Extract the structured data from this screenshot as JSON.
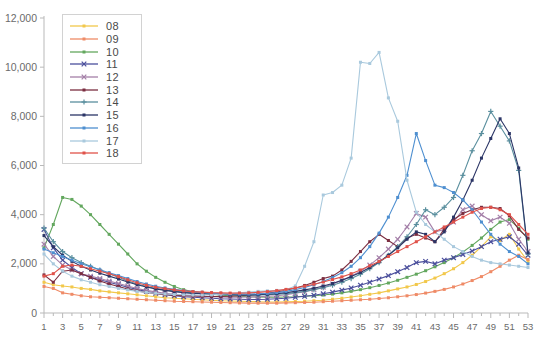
{
  "chart_data": {
    "type": "line",
    "title": "",
    "xlabel": "",
    "ylabel": "",
    "xlim": [
      1,
      53
    ],
    "ylim": [
      0,
      12000
    ],
    "ytick_values": [
      0,
      2000,
      4000,
      6000,
      8000,
      10000,
      12000
    ],
    "ytick_labels": [
      "0",
      "2,000",
      "4,000",
      "6,000",
      "8,000",
      "10,000",
      "12,000"
    ],
    "x": [
      1,
      2,
      3,
      4,
      5,
      6,
      7,
      8,
      9,
      10,
      11,
      12,
      13,
      14,
      15,
      16,
      17,
      18,
      19,
      20,
      21,
      22,
      23,
      24,
      25,
      26,
      27,
      28,
      29,
      30,
      31,
      32,
      33,
      34,
      35,
      36,
      37,
      38,
      39,
      40,
      41,
      42,
      43,
      44,
      45,
      46,
      47,
      48,
      49,
      50,
      51,
      52,
      53
    ],
    "xtick_labels": [
      "1",
      "",
      "3",
      "",
      "5",
      "",
      "7",
      "",
      "9",
      "",
      "11",
      "",
      "13",
      "",
      "15",
      "",
      "17",
      "",
      "19",
      "",
      "21",
      "",
      "23",
      "",
      "25",
      "",
      "27",
      "",
      "29",
      "",
      "31",
      "",
      "33",
      "",
      "35",
      "",
      "37",
      "",
      "39",
      "",
      "41",
      "",
      "43",
      "",
      "45",
      "",
      "47",
      "",
      "49",
      "",
      "51",
      "",
      "53"
    ],
    "grid": false,
    "legend_position": "top-left",
    "series": [
      {
        "name": "08",
        "color": "#f2c84b",
        "marker": "dot",
        "values": [
          1250,
          1150,
          1100,
          1060,
          1000,
          960,
          900,
          860,
          820,
          780,
          740,
          700,
          660,
          620,
          600,
          580,
          560,
          540,
          520,
          500,
          490,
          480,
          470,
          460,
          450,
          450,
          460,
          470,
          480,
          500,
          520,
          560,
          600,
          650,
          700,
          760,
          820,
          900,
          980,
          1060,
          1160,
          1280,
          1420,
          1600,
          1800,
          2050,
          2350,
          2700,
          3100,
          2950,
          3200,
          2600,
          2100
        ]
      },
      {
        "name": "09",
        "color": "#ef8b67",
        "marker": "dot",
        "values": [
          1080,
          1000,
          820,
          760,
          700,
          660,
          640,
          620,
          600,
          580,
          560,
          540,
          520,
          500,
          480,
          470,
          460,
          450,
          440,
          430,
          420,
          410,
          400,
          400,
          400,
          400,
          410,
          420,
          430,
          440,
          460,
          480,
          500,
          520,
          540,
          560,
          590,
          620,
          660,
          700,
          750,
          810,
          880,
          960,
          1060,
          1180,
          1320,
          1480,
          1680,
          1900,
          2150,
          2350,
          2180
        ]
      },
      {
        "name": "10",
        "color": "#63a75e",
        "marker": "dot",
        "values": [
          2650,
          3600,
          4700,
          4620,
          4350,
          4000,
          3600,
          3200,
          2800,
          2400,
          2000,
          1700,
          1450,
          1250,
          1080,
          950,
          860,
          800,
          760,
          720,
          700,
          680,
          660,
          650,
          640,
          640,
          650,
          660,
          680,
          700,
          730,
          770,
          820,
          880,
          950,
          1030,
          1120,
          1220,
          1330,
          1450,
          1580,
          1720,
          1880,
          2050,
          2250,
          2480,
          2750,
          3050,
          3400,
          3700,
          3800,
          3450,
          3000
        ]
      },
      {
        "name": "11",
        "color": "#4b4f9c",
        "marker": "x",
        "values": [
          3400,
          2650,
          2150,
          1850,
          1600,
          1450,
          1350,
          1250,
          1150,
          1050,
          960,
          880,
          800,
          740,
          700,
          660,
          640,
          620,
          600,
          580,
          570,
          560,
          550,
          550,
          560,
          580,
          600,
          640,
          680,
          720,
          780,
          850,
          930,
          1020,
          1130,
          1250,
          1380,
          1520,
          1680,
          1850,
          2050,
          2100,
          2000,
          2150,
          2250,
          2380,
          2520,
          2700,
          2900,
          3000,
          3100,
          2800,
          2350
        ]
      },
      {
        "name": "12",
        "color": "#a47fa8",
        "marker": "x",
        "values": [
          2800,
          2300,
          1950,
          1750,
          1600,
          1500,
          1400,
          1300,
          1200,
          1100,
          1000,
          920,
          860,
          800,
          760,
          720,
          700,
          680,
          660,
          650,
          640,
          640,
          650,
          660,
          680,
          700,
          740,
          800,
          870,
          950,
          1050,
          1180,
          1320,
          1500,
          1700,
          1950,
          2250,
          2600,
          3000,
          3500,
          4050,
          3900,
          3300,
          3400,
          3700,
          4200,
          4350,
          4000,
          3750,
          3900,
          3650,
          3000,
          2500
        ]
      },
      {
        "name": "13",
        "color": "#7b2d40",
        "marker": "dot",
        "values": [
          1550,
          1250,
          1700,
          1750,
          1600,
          1450,
          1300,
          1180,
          1080,
          980,
          900,
          840,
          790,
          750,
          720,
          700,
          690,
          680,
          670,
          670,
          680,
          700,
          720,
          760,
          800,
          860,
          930,
          1020,
          1120,
          1250,
          1400,
          1500,
          1750,
          2100,
          2500,
          2900,
          3200,
          2950,
          2700,
          3050,
          3200,
          3050,
          2900,
          3400,
          3800,
          4050,
          4200,
          4300,
          4300,
          4250,
          3950,
          3400,
          3050
        ]
      },
      {
        "name": "14",
        "color": "#5a8f9e",
        "marker": "plus",
        "values": [
          3450,
          2900,
          2500,
          2250,
          2050,
          1900,
          1750,
          1600,
          1450,
          1300,
          1180,
          1080,
          1000,
          940,
          890,
          850,
          820,
          800,
          780,
          760,
          750,
          740,
          730,
          730,
          740,
          760,
          790,
          830,
          880,
          950,
          1030,
          1130,
          1250,
          1400,
          1580,
          1800,
          2050,
          2350,
          2700,
          3100,
          3600,
          4200,
          4000,
          4300,
          4700,
          5600,
          6600,
          7300,
          8200,
          7600,
          7000,
          5800,
          2400
        ]
      },
      {
        "name": "15",
        "color": "#2b3566",
        "marker": "dot",
        "values": [
          3150,
          2700,
          2350,
          2100,
          1900,
          1750,
          1620,
          1500,
          1380,
          1260,
          1150,
          1060,
          980,
          920,
          870,
          830,
          800,
          780,
          760,
          750,
          740,
          730,
          730,
          740,
          760,
          790,
          830,
          880,
          940,
          1010,
          1100,
          1200,
          1330,
          1480,
          1650,
          1850,
          2080,
          2350,
          2650,
          3000,
          3300,
          3200,
          2900,
          3300,
          3900,
          4600,
          5400,
          6300,
          7100,
          7900,
          7300,
          5900,
          2450
        ]
      },
      {
        "name": "16",
        "color": "#4e8fd0",
        "marker": "dot",
        "values": [
          2600,
          2450,
          2300,
          2150,
          2000,
          1880,
          1760,
          1640,
          1520,
          1400,
          1280,
          1180,
          1090,
          1020,
          960,
          910,
          870,
          840,
          810,
          790,
          780,
          770,
          770,
          780,
          800,
          830,
          880,
          950,
          1040,
          1150,
          1280,
          1440,
          1640,
          1900,
          2250,
          2700,
          3250,
          3900,
          4700,
          5600,
          7300,
          6200,
          5200,
          5100,
          4900,
          4600,
          4200,
          3700,
          3200,
          2800,
          2500,
          2300,
          2000
        ]
      },
      {
        "name": "17",
        "color": "#a9c9dd",
        "marker": "dot",
        "values": [
          2400,
          2000,
          1700,
          1500,
          1350,
          1250,
          1150,
          1080,
          1000,
          940,
          880,
          840,
          800,
          770,
          750,
          740,
          730,
          730,
          740,
          760,
          790,
          820,
          850,
          880,
          900,
          920,
          950,
          1100,
          1900,
          2900,
          4800,
          4900,
          5200,
          6300,
          10200,
          10150,
          10600,
          8750,
          7800,
          5400,
          4100,
          3600,
          3300,
          3000,
          2700,
          2500,
          2300,
          2150,
          2050,
          2000,
          1950,
          1900,
          1850
        ]
      },
      {
        "name": "18",
        "color": "#e0524a",
        "marker": "dot",
        "values": [
          1500,
          1600,
          1900,
          1950,
          1900,
          1800,
          1700,
          1600,
          1480,
          1350,
          1230,
          1130,
          1050,
          990,
          940,
          900,
          870,
          850,
          830,
          820,
          810,
          810,
          820,
          840,
          870,
          910,
          960,
          1020,
          1090,
          1170,
          1260,
          1360,
          1470,
          1600,
          1750,
          1920,
          2100,
          2300,
          2500,
          2700,
          2900,
          3100,
          3300,
          3500,
          3700,
          3900,
          4100,
          4250,
          4300,
          4200,
          4000,
          3600,
          3200
        ]
      }
    ]
  },
  "legend": {
    "items": [
      {
        "label": "08"
      },
      {
        "label": "09"
      },
      {
        "label": "10"
      },
      {
        "label": "11"
      },
      {
        "label": "12"
      },
      {
        "label": "13"
      },
      {
        "label": "14"
      },
      {
        "label": "15"
      },
      {
        "label": "16"
      },
      {
        "label": "17"
      },
      {
        "label": "18"
      }
    ]
  }
}
